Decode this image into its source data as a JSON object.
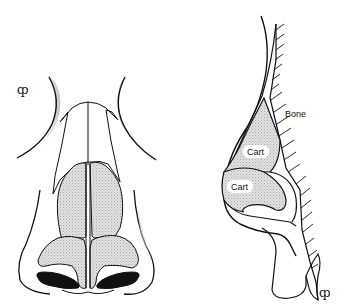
{
  "diagram": {
    "colors": {
      "line": "#111111",
      "cartilage_fill": "#d9d9d9",
      "shadow": "#cfcfcf",
      "nostril": "#111111",
      "background": "#ffffff"
    },
    "frontal_view": {
      "symbol": "ȹ",
      "parts": [
        "brow-shadow-left",
        "brow-shadow-right",
        "nasal-bones",
        "upper-lateral-cartilages",
        "lower-lateral-cartilages",
        "septum",
        "ala-left",
        "ala-right",
        "nostril-left",
        "nostril-right"
      ]
    },
    "lateral_view": {
      "symbol": "ȹ",
      "labels": {
        "bone": "Bone",
        "cart_upper": "Cart",
        "cart_lower": "Cart"
      },
      "parts": [
        "skin-profile",
        "bone-hatching",
        "upper-lateral-cartilage",
        "lower-lateral-cartilage",
        "ala",
        "lip"
      ]
    }
  }
}
